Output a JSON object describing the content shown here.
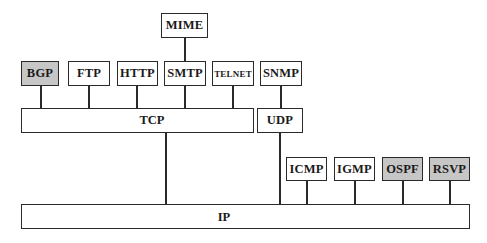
{
  "diagram": {
    "colors": {
      "stroke": "#2a2a2a",
      "fill_default": "#ffffff",
      "fill_shaded": "#c6c6c6",
      "text": "#1a1a1a"
    },
    "layers": {
      "mime": {
        "label": "MIME"
      },
      "application": [
        {
          "id": "bgp",
          "label": "BGP",
          "shaded": true
        },
        {
          "id": "ftp",
          "label": "FTP",
          "shaded": false
        },
        {
          "id": "http",
          "label": "HTTP",
          "shaded": false
        },
        {
          "id": "smtp",
          "label": "SMTP",
          "shaded": false
        },
        {
          "id": "telnet",
          "label": "TELNET",
          "shaded": false
        },
        {
          "id": "snmp",
          "label": "SNMP",
          "shaded": false
        }
      ],
      "transport": [
        {
          "id": "tcp",
          "label": "TCP"
        },
        {
          "id": "udp",
          "label": "UDP"
        }
      ],
      "ip_helpers": [
        {
          "id": "icmp",
          "label": "ICMP",
          "shaded": false
        },
        {
          "id": "igmp",
          "label": "IGMP",
          "shaded": false
        },
        {
          "id": "ospf",
          "label": "OSPF",
          "shaded": true
        },
        {
          "id": "rsvp",
          "label": "RSVP",
          "shaded": true
        }
      ],
      "network": {
        "id": "ip",
        "label": "IP"
      }
    },
    "connections": [
      [
        "MIME",
        "SMTP"
      ],
      [
        "BGP",
        "TCP"
      ],
      [
        "FTP",
        "TCP"
      ],
      [
        "HTTP",
        "TCP"
      ],
      [
        "SMTP",
        "TCP"
      ],
      [
        "TELNET",
        "TCP"
      ],
      [
        "SNMP",
        "UDP"
      ],
      [
        "TCP",
        "IP"
      ],
      [
        "UDP",
        "IP"
      ],
      [
        "ICMP",
        "IP"
      ],
      [
        "IGMP",
        "IP"
      ],
      [
        "OSPF",
        "IP"
      ],
      [
        "RSVP",
        "IP"
      ]
    ]
  }
}
